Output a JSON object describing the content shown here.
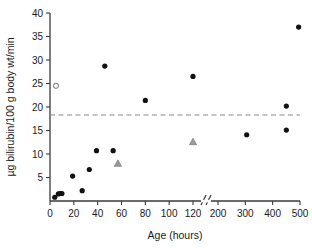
{
  "chart_data": {
    "type": "scatter",
    "title": "",
    "xlabel": "Age (hours)",
    "ylabel": "µg bilirubin/100 g body wt/min",
    "xticks": [
      0,
      20,
      40,
      60,
      80,
      100,
      120,
      200,
      300,
      400,
      500
    ],
    "xtick_labels": [
      "0",
      "20",
      "40",
      "60",
      "80",
      "100",
      "120",
      "200",
      "300",
      "400",
      "500"
    ],
    "yticks": [
      5,
      10,
      15,
      20,
      25,
      30,
      35,
      40
    ],
    "ytick_labels": [
      "5",
      "10",
      "15",
      "20",
      "25",
      "30",
      "35",
      "40"
    ],
    "ylim": [
      0,
      40
    ],
    "xlim": [
      0,
      500
    ],
    "axis_break": {
      "present": true,
      "between": [
        120,
        200
      ],
      "glyph": "//"
    },
    "grid": false,
    "legend": null,
    "reference_line": {
      "type": "horizontal-dashed",
      "y": 18.3,
      "color": "#8a8a8a"
    },
    "series": [
      {
        "name": "filled-circles",
        "marker": "filled-circle",
        "color": "#111111",
        "points": [
          {
            "x": 4,
            "y": 0.8
          },
          {
            "x": 7,
            "y": 1.5
          },
          {
            "x": 8.5,
            "y": 1.6
          },
          {
            "x": 10,
            "y": 1.6
          },
          {
            "x": 19,
            "y": 5.3
          },
          {
            "x": 27,
            "y": 2.2
          },
          {
            "x": 33,
            "y": 6.7
          },
          {
            "x": 39,
            "y": 10.7
          },
          {
            "x": 46,
            "y": 28.7
          },
          {
            "x": 53,
            "y": 10.7
          },
          {
            "x": 80,
            "y": 21.4
          },
          {
            "x": 120,
            "y": 26.5
          },
          {
            "x": 305,
            "y": 14.1
          },
          {
            "x": 450,
            "y": 20.2
          },
          {
            "x": 450,
            "y": 15.1
          },
          {
            "x": 495,
            "y": 37.0
          }
        ]
      },
      {
        "name": "open-circle",
        "marker": "open-circle",
        "color": "#8d8d8d",
        "points": [
          {
            "x": 5,
            "y": 24.5
          }
        ]
      },
      {
        "name": "gray-triangles",
        "marker": "filled-triangle",
        "color": "#9a9a9a",
        "points": [
          {
            "x": 57,
            "y": 8.0
          },
          {
            "x": 120,
            "y": 12.6
          }
        ]
      }
    ]
  },
  "figure": {
    "background": "#ffffff",
    "axis_color": "#3a3a3a"
  }
}
